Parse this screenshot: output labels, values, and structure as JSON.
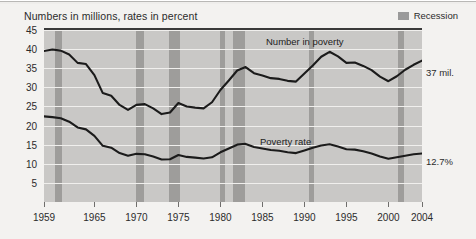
{
  "chart_data": {
    "type": "line",
    "title": "Numbers in millions, rates in percent",
    "xlabel": "",
    "ylabel": "",
    "ylim": [
      0,
      45
    ],
    "xlim": [
      1959,
      2004
    ],
    "grid": true,
    "legend_position": "top-right",
    "legend": [
      {
        "label": "Recession",
        "color": "#9e9d9b",
        "marker": "band"
      }
    ],
    "y_ticks": [
      45,
      40,
      35,
      30,
      25,
      20,
      15,
      10,
      5
    ],
    "x_ticks": [
      1959,
      1965,
      1970,
      1975,
      1980,
      1985,
      1990,
      1995,
      2000,
      2004
    ],
    "annotations": [
      {
        "text": "Number in poverty",
        "series": "Number in poverty",
        "x": 1988
      },
      {
        "text": "Poverty rate",
        "series": "Poverty rate",
        "x": 1988
      },
      {
        "text": "37 mil.",
        "series": "Number in poverty",
        "x": 2004,
        "value": 37.0
      },
      {
        "text": "12.7%",
        "series": "Poverty rate",
        "x": 2004,
        "value": 12.7
      }
    ],
    "recession_bands": [
      {
        "start": 1960.3,
        "end": 1961.1
      },
      {
        "start": 1969.9,
        "end": 1970.9
      },
      {
        "start": 1973.9,
        "end": 1975.2
      },
      {
        "start": 1980.0,
        "end": 1980.6
      },
      {
        "start": 1981.5,
        "end": 1982.9
      },
      {
        "start": 1990.5,
        "end": 1991.2
      },
      {
        "start": 2001.2,
        "end": 2001.9
      }
    ],
    "x": [
      1959,
      1960,
      1961,
      1962,
      1963,
      1964,
      1965,
      1966,
      1967,
      1968,
      1969,
      1970,
      1971,
      1972,
      1973,
      1974,
      1975,
      1976,
      1977,
      1978,
      1979,
      1980,
      1981,
      1982,
      1983,
      1984,
      1985,
      1986,
      1987,
      1988,
      1989,
      1990,
      1991,
      1992,
      1993,
      1994,
      1995,
      1996,
      1997,
      1998,
      1999,
      2000,
      2001,
      2002,
      2003,
      2004
    ],
    "series": [
      {
        "name": "Number in poverty",
        "units": "millions",
        "color": "#1b1b1b",
        "end_label": "37 mil.",
        "values": [
          39.5,
          39.9,
          39.6,
          38.6,
          36.4,
          36.1,
          33.2,
          28.5,
          27.8,
          25.4,
          24.1,
          25.4,
          25.6,
          24.5,
          23.0,
          23.4,
          25.9,
          25.0,
          24.7,
          24.5,
          26.1,
          29.3,
          31.8,
          34.4,
          35.3,
          33.7,
          33.1,
          32.4,
          32.2,
          31.7,
          31.5,
          33.6,
          35.7,
          38.0,
          39.3,
          38.1,
          36.4,
          36.5,
          35.6,
          34.5,
          32.8,
          31.6,
          32.9,
          34.6,
          35.9,
          37.0
        ]
      },
      {
        "name": "Poverty rate",
        "units": "percent",
        "color": "#1b1b1b",
        "end_label": "12.7%",
        "values": [
          22.4,
          22.2,
          21.9,
          21.0,
          19.5,
          19.0,
          17.3,
          14.7,
          14.2,
          12.8,
          12.1,
          12.6,
          12.5,
          11.9,
          11.1,
          11.2,
          12.3,
          11.8,
          11.6,
          11.4,
          11.7,
          13.0,
          14.0,
          15.0,
          15.2,
          14.4,
          14.0,
          13.6,
          13.4,
          13.0,
          12.8,
          13.5,
          14.2,
          14.8,
          15.1,
          14.5,
          13.8,
          13.7,
          13.3,
          12.7,
          11.9,
          11.3,
          11.7,
          12.1,
          12.5,
          12.7
        ]
      }
    ]
  },
  "colors": {
    "page_background": "#f3f2f0",
    "plot_background": "#c9c8c6",
    "recession_band": "#9e9d9b",
    "gridline": "#f0efed",
    "line": "#1b1b1b",
    "text": "#2b2b2b"
  }
}
